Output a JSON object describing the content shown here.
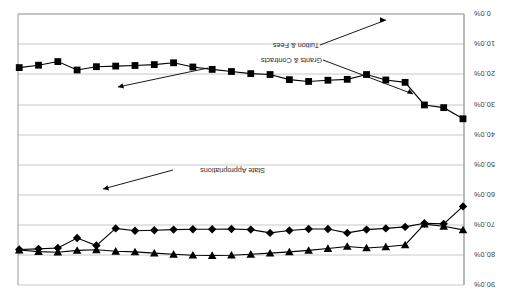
{
  "chart_data": {
    "type": "line",
    "title": "",
    "xlabel": "",
    "ylabel": "",
    "ylim": [
      0,
      90
    ],
    "y_tick_labels": [
      "0.0%",
      "10.0%",
      "20.0%",
      "30.0%",
      "40.0%",
      "50.0%",
      "60.0%",
      "70.0%",
      "80.0%",
      "90.0%"
    ],
    "y_ticks": [
      0,
      10,
      20,
      30,
      40,
      50,
      60,
      70,
      80,
      90
    ],
    "grid": true,
    "legend": "annotations-with-leader-lines",
    "x": [
      1,
      2,
      3,
      4,
      5,
      6,
      7,
      8,
      9,
      10,
      11,
      12,
      13,
      14,
      15,
      16,
      17,
      18,
      19,
      20,
      21,
      22,
      23,
      24
    ],
    "series": [
      {
        "name": "State Appropriations",
        "marker": "square",
        "color": "#000000",
        "values": [
          55.2,
          58.9,
          59.8,
          67.3,
          68.1,
          69.9,
          68.3,
          68.0,
          67.6,
          68.2,
          69.9,
          70.2,
          70.9,
          71.6,
          72.4,
          73.8,
          73.2,
          72.9,
          72.7,
          72.5,
          71.4,
          74.2,
          73.0,
          72.2
        ]
      },
      {
        "name": "Tuition & Fees",
        "marker": "diamond",
        "color": "#000000",
        "values": [
          26.1,
          20.3,
          20.5,
          19.3,
          18.8,
          18.4,
          17.3,
          18.6,
          18.6,
          18.1,
          17.3,
          18.4,
          18.6,
          18.5,
          18.5,
          18.4,
          18.2,
          18.0,
          18.8,
          13.1,
          15.6,
          12.3,
          12.0,
          11.8
        ]
      },
      {
        "name": "Grants & Contracts",
        "marker": "triangle-down",
        "color": "#000000",
        "values": [
          18.3,
          19.5,
          20.2,
          13.3,
          12.7,
          12.3,
          12.8,
          12.1,
          11.5,
          11.0,
          10.6,
          10.2,
          9.9,
          9.8,
          9.9,
          10.2,
          10.6,
          11.0,
          11.2,
          11.7,
          11.5,
          10.9,
          11.1,
          11.6
        ]
      }
    ],
    "annotations": [
      {
        "name": "Grants & Contracts",
        "text": "Grants & Contracts"
      },
      {
        "name": "Tuition & Fees",
        "text": "Tuition & Fees"
      },
      {
        "name": "State Appropriations",
        "text": "State Appropriations"
      }
    ]
  },
  "labels": {
    "y0": "0.0%",
    "y10": "10.0%",
    "y20": "20.0%",
    "y30": "30.0%",
    "y40": "40.0%",
    "y50": "50.0%",
    "y60": "60.0%",
    "y70": "70.0%",
    "y80": "80.0%",
    "y90": "90.0%",
    "grants": "Grants & Contracts",
    "tuition": "Tuition & Fees",
    "state": "State Appropriations"
  },
  "colors": {
    "series": "#000000",
    "grid": "#c8c8c8",
    "axis": "#8a8a8a",
    "text": "#3a3a3a"
  }
}
